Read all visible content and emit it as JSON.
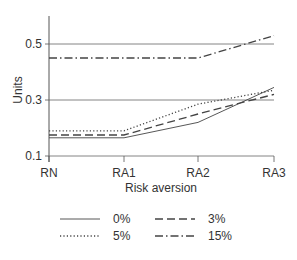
{
  "chart_data": {
    "type": "line",
    "title": "",
    "xlabel": "Risk aversion",
    "ylabel": "Units",
    "categories": [
      "RN",
      "RA1",
      "RA2",
      "RA3"
    ],
    "yticks": [
      "0.1",
      "0.3",
      "0.5"
    ],
    "ylim": [
      0.1,
      0.6
    ],
    "grid": "horizontal at 0.1, 0.3, 0.5",
    "legend_position": "bottom",
    "series": [
      {
        "name": "0%",
        "style": "solid",
        "values": [
          0.165,
          0.165,
          0.22,
          0.345
        ]
      },
      {
        "name": "3%",
        "style": "dashed",
        "values": [
          0.175,
          0.175,
          0.25,
          0.32
        ]
      },
      {
        "name": "5%",
        "style": "dotted",
        "values": [
          0.19,
          0.19,
          0.285,
          0.335
        ]
      },
      {
        "name": "15%",
        "style": "dashdot",
        "values": [
          0.45,
          0.45,
          0.45,
          0.53
        ]
      }
    ]
  },
  "legend": {
    "items": [
      {
        "label": "0%"
      },
      {
        "label": "3%"
      },
      {
        "label": "5%"
      },
      {
        "label": "15%"
      }
    ]
  }
}
